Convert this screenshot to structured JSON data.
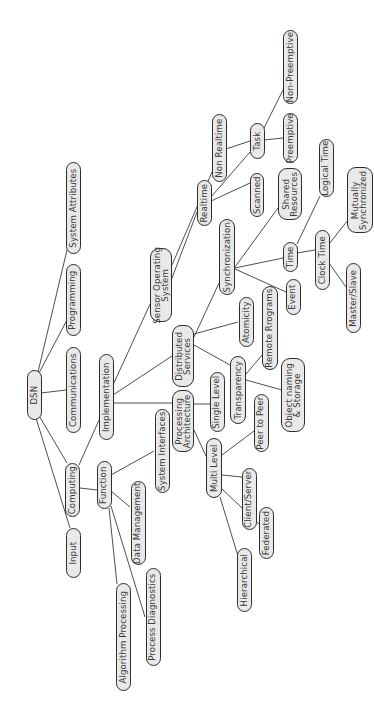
{
  "diagram": {
    "title": "DSN",
    "orientation": "rotated -90deg (text reads bottom-to-top)",
    "nodes": [
      {
        "id": "dsn",
        "label": "DSN",
        "cx": 34,
        "cy": 395,
        "w": 15,
        "h": 50
      },
      {
        "id": "input",
        "label": "Input",
        "cx": 73,
        "cy": 553,
        "w": 15,
        "h": 50
      },
      {
        "id": "computing",
        "label": "Computing",
        "cx": 72,
        "cy": 490,
        "w": 15,
        "h": 54
      },
      {
        "id": "communications",
        "label": "Communications",
        "cx": 73,
        "cy": 390,
        "w": 15,
        "h": 86
      },
      {
        "id": "programming",
        "label": "Programming",
        "cx": 73,
        "cy": 300,
        "w": 15,
        "h": 72
      },
      {
        "id": "system-attributes",
        "label": "System Attributes",
        "cx": 73,
        "cy": 208,
        "w": 15,
        "h": 92
      },
      {
        "id": "function",
        "label": "Function",
        "cx": 104,
        "cy": 485,
        "w": 15,
        "h": 48
      },
      {
        "id": "implementation",
        "label": "Implementation",
        "cx": 106,
        "cy": 397,
        "w": 15,
        "h": 86
      },
      {
        "id": "algorithm-processing",
        "label": "Algorithm Processing",
        "cx": 123,
        "cy": 637,
        "w": 15,
        "h": 108
      },
      {
        "id": "process-diagnostics",
        "label": "Process Diagnostics",
        "cx": 153,
        "cy": 617,
        "w": 15,
        "h": 98
      },
      {
        "id": "data-management",
        "label": "Data Management",
        "cx": 138,
        "cy": 523,
        "w": 15,
        "h": 84
      },
      {
        "id": "system-interfaces",
        "label": "System Interfaces",
        "cx": 162,
        "cy": 451,
        "w": 15,
        "h": 84
      },
      {
        "id": "sensor-operating-system",
        "label": "Sensor Operating\nSystem",
        "cx": 161,
        "cy": 285,
        "w": 22,
        "h": 74
      },
      {
        "id": "distributed-services",
        "label": "Distributed\nServices",
        "cx": 183,
        "cy": 356,
        "w": 22,
        "h": 62
      },
      {
        "id": "processing-architecture",
        "label": "Processing\nArchitecture",
        "cx": 183,
        "cy": 421,
        "w": 22,
        "h": 62
      },
      {
        "id": "single-level",
        "label": "Single Level",
        "cx": 217,
        "cy": 402,
        "w": 15,
        "h": 60
      },
      {
        "id": "multi-level",
        "label": "Multi Level",
        "cx": 214,
        "cy": 468,
        "w": 16,
        "h": 60
      },
      {
        "id": "hierarchical",
        "label": "Hierarchical",
        "cx": 244,
        "cy": 580,
        "w": 15,
        "h": 64
      },
      {
        "id": "federated",
        "label": "Federated",
        "cx": 266,
        "cy": 533,
        "w": 15,
        "h": 52
      },
      {
        "id": "client-server",
        "label": "Client/Server",
        "cx": 249,
        "cy": 499,
        "w": 15,
        "h": 62
      },
      {
        "id": "peer-to-peer",
        "label": "Peer to Peer",
        "cx": 261,
        "cy": 423,
        "w": 15,
        "h": 58
      },
      {
        "id": "transparency",
        "label": "Transparency",
        "cx": 238,
        "cy": 390,
        "w": 16,
        "h": 68
      },
      {
        "id": "object-naming-storage",
        "label": "Object naming\n& Storage",
        "cx": 293,
        "cy": 395,
        "w": 24,
        "h": 74
      },
      {
        "id": "remote-programs",
        "label": "Remote Rrograms",
        "cx": 270,
        "cy": 328,
        "w": 16,
        "h": 84
      },
      {
        "id": "atomicity",
        "label": "Atomicity",
        "cx": 246,
        "cy": 322,
        "w": 15,
        "h": 50
      },
      {
        "id": "synchronization",
        "label": "Synchronization",
        "cx": 227,
        "cy": 257,
        "w": 16,
        "h": 76
      },
      {
        "id": "event",
        "label": "Event",
        "cx": 293,
        "cy": 297,
        "w": 15,
        "h": 36
      },
      {
        "id": "realtime",
        "label": "Realtime",
        "cx": 204,
        "cy": 203,
        "w": 15,
        "h": 46
      },
      {
        "id": "non-realtime",
        "label": "Non Realtime",
        "cx": 219,
        "cy": 148,
        "w": 15,
        "h": 68
      },
      {
        "id": "scanned",
        "label": "Scanned",
        "cx": 257,
        "cy": 195,
        "w": 14,
        "h": 44
      },
      {
        "id": "task",
        "label": "Task",
        "cx": 257,
        "cy": 141,
        "w": 15,
        "h": 36
      },
      {
        "id": "preemptive",
        "label": "Preemptive",
        "cx": 290,
        "cy": 138,
        "w": 15,
        "h": 50
      },
      {
        "id": "non-preemptive",
        "label": "Non-Preemptive",
        "cx": 290,
        "cy": 67,
        "w": 15,
        "h": 74
      },
      {
        "id": "shared-resources",
        "label": "Shared\nResources",
        "cx": 290,
        "cy": 194,
        "w": 24,
        "h": 52
      },
      {
        "id": "time",
        "label": "Time",
        "cx": 290,
        "cy": 257,
        "w": 15,
        "h": 30
      },
      {
        "id": "logical-time",
        "label": "Logical Time",
        "cx": 326,
        "cy": 168,
        "w": 15,
        "h": 58
      },
      {
        "id": "clock-time",
        "label": "Clock Time",
        "cx": 322,
        "cy": 260,
        "w": 15,
        "h": 60
      },
      {
        "id": "mutually-synchronized",
        "label": "Mutually\nSynchronized",
        "cx": 360,
        "cy": 200,
        "w": 26,
        "h": 66
      },
      {
        "id": "master-slave",
        "label": "Master/Slave",
        "cx": 353,
        "cy": 298,
        "w": 15,
        "h": 70
      }
    ],
    "edges": [
      {
        "from": "dsn",
        "to": "input",
        "x1": 36,
        "y1": 418,
        "x2": 70,
        "y2": 528
      },
      {
        "from": "dsn",
        "to": "computing",
        "x1": 38,
        "y1": 414,
        "x2": 67,
        "y2": 463
      },
      {
        "from": "dsn",
        "to": "communications",
        "x1": 41,
        "y1": 393,
        "x2": 66,
        "y2": 390
      },
      {
        "from": "dsn",
        "to": "programming",
        "x1": 39,
        "y1": 373,
        "x2": 67,
        "y2": 320
      },
      {
        "from": "dsn",
        "to": "system-attributes",
        "x1": 38,
        "y1": 372,
        "x2": 67,
        "y2": 250
      },
      {
        "from": "computing",
        "to": "implementation",
        "x1": 79,
        "y1": 465,
        "x2": 99,
        "y2": 420
      },
      {
        "from": "computing",
        "to": "function",
        "x1": 80,
        "y1": 488,
        "x2": 97,
        "y2": 490
      },
      {
        "from": "function",
        "to": "algorithm-processing",
        "x1": 109,
        "y1": 508,
        "x2": 117,
        "y2": 584
      },
      {
        "from": "function",
        "to": "process-diagnostics",
        "x1": 111,
        "y1": 506,
        "x2": 145,
        "y2": 617
      },
      {
        "from": "function",
        "to": "data-management",
        "x1": 111,
        "y1": 491,
        "x2": 130,
        "y2": 507
      },
      {
        "from": "function",
        "to": "system-interfaces",
        "x1": 111,
        "y1": 475,
        "x2": 154,
        "y2": 451
      },
      {
        "from": "implementation",
        "to": "sensor-operating-system",
        "x1": 113,
        "y1": 385,
        "x2": 151,
        "y2": 302
      },
      {
        "from": "implementation",
        "to": "distributed-services",
        "x1": 113,
        "y1": 395,
        "x2": 172,
        "y2": 356
      },
      {
        "from": "implementation",
        "to": "processing-architecture",
        "x1": 113,
        "y1": 403,
        "x2": 172,
        "y2": 403
      },
      {
        "from": "sensor-operating-system",
        "to": "realtime",
        "x1": 172,
        "y1": 278,
        "x2": 197,
        "y2": 212
      },
      {
        "from": "sensor-operating-system",
        "to": "non-realtime",
        "x1": 172,
        "y1": 265,
        "x2": 212,
        "y2": 172
      },
      {
        "from": "realtime",
        "to": "scanned",
        "x1": 211,
        "y1": 201,
        "x2": 250,
        "y2": 183
      },
      {
        "from": "realtime",
        "to": "task",
        "x1": 211,
        "y1": 197,
        "x2": 250,
        "y2": 152
      },
      {
        "from": "non-realtime",
        "to": "task",
        "x1": 226,
        "y1": 149,
        "x2": 250,
        "y2": 141
      },
      {
        "from": "task",
        "to": "preemptive",
        "x1": 264,
        "y1": 140,
        "x2": 283,
        "y2": 138
      },
      {
        "from": "task",
        "to": "non-preemptive",
        "x1": 264,
        "y1": 128,
        "x2": 283,
        "y2": 90
      },
      {
        "from": "distributed-services",
        "to": "synchronization",
        "x1": 194,
        "y1": 337,
        "x2": 219,
        "y2": 283
      },
      {
        "from": "distributed-services",
        "to": "atomicity",
        "x1": 194,
        "y1": 334,
        "x2": 238,
        "y2": 322
      },
      {
        "from": "distributed-services",
        "to": "transparency",
        "x1": 194,
        "y1": 345,
        "x2": 230,
        "y2": 365
      },
      {
        "from": "synchronization",
        "to": "shared-resources",
        "x1": 235,
        "y1": 267,
        "x2": 278,
        "y2": 208
      },
      {
        "from": "synchronization",
        "to": "time",
        "x1": 235,
        "y1": 268,
        "x2": 283,
        "y2": 258
      },
      {
        "from": "synchronization",
        "to": "event",
        "x1": 235,
        "y1": 269,
        "x2": 286,
        "y2": 292
      },
      {
        "from": "time",
        "to": "logical-time",
        "x1": 297,
        "y1": 244,
        "x2": 320,
        "y2": 196
      },
      {
        "from": "time",
        "to": "clock-time",
        "x1": 297,
        "y1": 253,
        "x2": 315,
        "y2": 250
      },
      {
        "from": "clock-time",
        "to": "mutually-synchronized",
        "x1": 329,
        "y1": 244,
        "x2": 348,
        "y2": 220
      },
      {
        "from": "clock-time",
        "to": "master-slave",
        "x1": 329,
        "y1": 263,
        "x2": 346,
        "y2": 287
      },
      {
        "from": "transparency",
        "to": "remote-programs",
        "x1": 246,
        "y1": 374,
        "x2": 263,
        "y2": 354
      },
      {
        "from": "transparency",
        "to": "object-naming-storage",
        "x1": 246,
        "y1": 380,
        "x2": 282,
        "y2": 390
      },
      {
        "from": "processing-architecture",
        "to": "single-level",
        "x1": 194,
        "y1": 404,
        "x2": 210,
        "y2": 404
      },
      {
        "from": "processing-architecture",
        "to": "multi-level",
        "x1": 194,
        "y1": 430,
        "x2": 206,
        "y2": 456
      },
      {
        "from": "multi-level",
        "to": "peer-to-peer",
        "x1": 222,
        "y1": 455,
        "x2": 254,
        "y2": 431
      },
      {
        "from": "multi-level",
        "to": "client-server",
        "x1": 222,
        "y1": 475,
        "x2": 242,
        "y2": 477
      },
      {
        "from": "multi-level",
        "to": "federated",
        "x1": 222,
        "y1": 489,
        "x2": 259,
        "y2": 524
      },
      {
        "from": "multi-level",
        "to": "hierarchical",
        "x1": 220,
        "y1": 497,
        "x2": 238,
        "y2": 556
      }
    ]
  },
  "colors": {
    "node_fill": "#e9e9e9",
    "node_border": "#2e2e2e",
    "text": "#3a3a3a",
    "edge": "#3a3a3a",
    "background": "#ffffff"
  }
}
